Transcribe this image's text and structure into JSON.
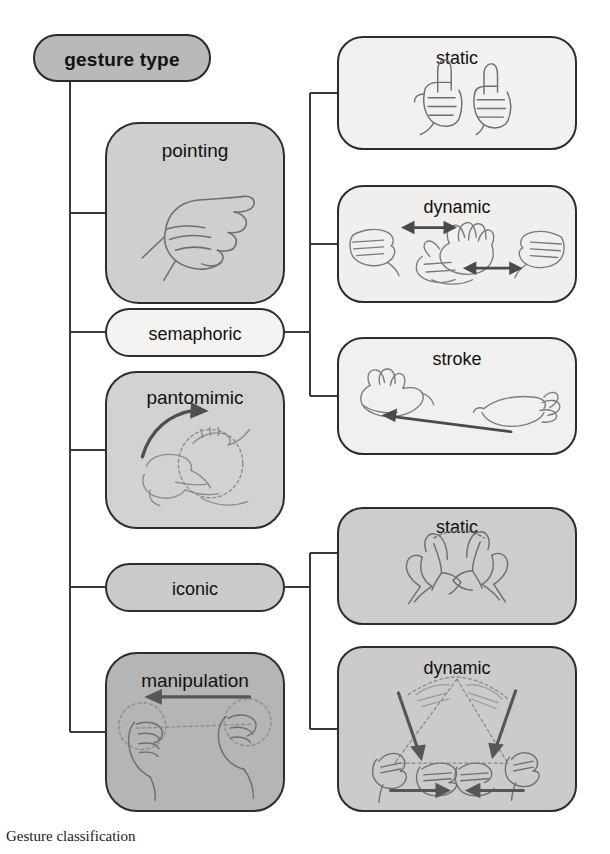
{
  "figure": {
    "caption": "Gesture classification",
    "root": {
      "label": "gesture type"
    },
    "categories": [
      {
        "id": "pointing",
        "label": "pointing",
        "fill": "#cfcfcf",
        "shape": "rounded-square",
        "illustration": "pointing-hand"
      },
      {
        "id": "semaphoric",
        "label": "semaphoric",
        "fill": "#f4f3f1",
        "shape": "pill",
        "illustration": "none"
      },
      {
        "id": "pantomimic",
        "label": "pantomimic",
        "fill": "#d2d2d2",
        "shape": "rounded-square",
        "illustration": "hands-playing-tambourine-with-curved-arrow"
      },
      {
        "id": "iconic",
        "label": "iconic",
        "fill": "#cbcbcb",
        "shape": "pill",
        "illustration": "none"
      },
      {
        "id": "manipulation",
        "label": "manipulation",
        "fill": "#b5b5b5",
        "shape": "rounded-square",
        "illustration": "two-hands-moving-object-left"
      }
    ],
    "subtypes": [
      {
        "id": "sem-static",
        "parent": "semaphoric",
        "label": "static",
        "fill": "#f2f1ef",
        "illustration": "two-thumbs-up-hands"
      },
      {
        "id": "sem-dynamic",
        "parent": "semaphoric",
        "label": "dynamic",
        "fill": "#f0efed",
        "illustration": "hands-with-horizontal-double-arrows"
      },
      {
        "id": "sem-stroke",
        "parent": "semaphoric",
        "label": "stroke",
        "fill": "#f1f0ee",
        "illustration": "two-hands-with-single-left-arrow"
      },
      {
        "id": "ico-static",
        "parent": "iconic",
        "label": "static",
        "fill": "#cdcdcd",
        "illustration": "two-hands-forming-round-shape"
      },
      {
        "id": "ico-dynamic",
        "parent": "iconic",
        "label": "dynamic",
        "fill": "#cbcbcb",
        "illustration": "hands-moving-down-and-inward-triangle"
      }
    ],
    "colors": {
      "outline": "#2d2d2d",
      "connector": "#3a3a3a",
      "ink": "#6a6a6a",
      "arrow": "#5a5a5a",
      "text": "#111111",
      "background": "#ffffff"
    }
  }
}
